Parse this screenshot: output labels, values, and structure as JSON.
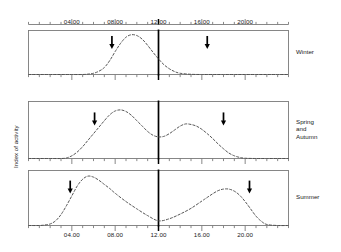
{
  "chart_data": {
    "type": "line",
    "title": "",
    "xlabel": "",
    "ylabel": "Index of activity",
    "xlim": [
      0,
      24
    ],
    "ylim": [
      0,
      1
    ],
    "grid": false,
    "legend_position": "right",
    "x_tick_labels": [
      "04.00",
      "08.00",
      "12.00",
      "16.00",
      "20.00"
    ],
    "x_tick_values": [
      4,
      8,
      12,
      16,
      20
    ],
    "minor_tick_interval_hours": 1,
    "noon_marker": {
      "label": "12.00",
      "value": 12,
      "style": "bold-vertical-line"
    },
    "line_style": "dashed",
    "line_color": "#4d4d4d",
    "axis_color": "#7a7a7a",
    "arrow_color": "#000000",
    "panels": [
      {
        "name": "Winter",
        "label": "Winter",
        "modality": "unimodal",
        "sunrise_arrow_hour": 7.7,
        "sunset_arrow_hour": 16.5,
        "peaks_hours": [
          9.6
        ],
        "x": [
          0,
          1,
          2,
          3,
          4,
          5,
          5.5,
          6,
          6.5,
          7,
          7.5,
          8,
          8.5,
          9,
          9.5,
          10,
          10.5,
          11,
          11.5,
          12,
          12.5,
          13,
          13.5,
          14,
          15,
          16,
          17,
          18,
          19,
          20,
          21,
          22,
          23,
          24
        ],
        "y": [
          0,
          0,
          0,
          0,
          0,
          0,
          0.01,
          0.03,
          0.08,
          0.17,
          0.34,
          0.56,
          0.76,
          0.91,
          0.97,
          0.95,
          0.86,
          0.71,
          0.54,
          0.38,
          0.24,
          0.14,
          0.07,
          0.03,
          0.005,
          0,
          0,
          0,
          0,
          0,
          0,
          0,
          0,
          0
        ]
      },
      {
        "name": "Spring and Autumn",
        "label": "Spring\nand\nAutumn",
        "label_lines": [
          "Spring",
          "and",
          "Autumn"
        ],
        "modality": "bimodal",
        "sunrise_arrow_hour": 6.1,
        "sunset_arrow_hour": 18.0,
        "peaks_hours": [
          8.2,
          14.6
        ],
        "trough_hour": 11.8,
        "x": [
          0,
          1,
          2,
          3,
          3.5,
          4,
          4.5,
          5,
          5.5,
          6,
          6.5,
          7,
          7.5,
          8,
          8.5,
          9,
          9.5,
          10,
          10.5,
          11,
          11.5,
          12,
          12.5,
          13,
          13.5,
          14,
          14.5,
          15,
          15.5,
          16,
          16.5,
          17,
          17.5,
          18,
          18.5,
          19,
          19.5,
          20,
          21,
          22,
          23,
          24
        ],
        "y": [
          0,
          0,
          0,
          0,
          0.01,
          0.05,
          0.12,
          0.22,
          0.34,
          0.46,
          0.58,
          0.7,
          0.81,
          0.88,
          0.9,
          0.87,
          0.8,
          0.7,
          0.6,
          0.5,
          0.43,
          0.4,
          0.41,
          0.46,
          0.53,
          0.6,
          0.64,
          0.63,
          0.6,
          0.54,
          0.46,
          0.37,
          0.27,
          0.18,
          0.1,
          0.05,
          0.02,
          0.005,
          0,
          0,
          0,
          0
        ]
      },
      {
        "name": "Summer",
        "label": "Summer",
        "modality": "bimodal",
        "sunrise_arrow_hour": 3.85,
        "sunset_arrow_hour": 20.4,
        "peaks_hours": [
          5.4,
          18.0
        ],
        "trough_hour": 12.0,
        "x": [
          0,
          1,
          1.5,
          2,
          2.5,
          3,
          3.5,
          4,
          4.5,
          5,
          5.5,
          6,
          6.5,
          7,
          7.5,
          8,
          9,
          10,
          11,
          12,
          13,
          14,
          15,
          16,
          16.5,
          17,
          17.5,
          18,
          18.5,
          19,
          19.5,
          20,
          20.5,
          21,
          21.5,
          22,
          23,
          24
        ],
        "y": [
          0,
          0,
          0.01,
          0.03,
          0.09,
          0.21,
          0.38,
          0.57,
          0.76,
          0.89,
          0.95,
          0.93,
          0.87,
          0.79,
          0.71,
          0.62,
          0.46,
          0.32,
          0.19,
          0.09,
          0.13,
          0.22,
          0.33,
          0.47,
          0.54,
          0.61,
          0.67,
          0.7,
          0.7,
          0.66,
          0.58,
          0.46,
          0.32,
          0.18,
          0.08,
          0.02,
          0,
          0
        ]
      }
    ]
  }
}
